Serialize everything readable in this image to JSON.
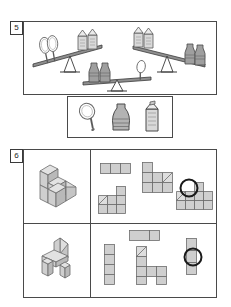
{
  "worksheet": {
    "title": "Geometry and logic worksheet page",
    "colors": {
      "ink": "#3a3a3a",
      "frame": "#4a4a4a",
      "block_face": "#cfcfcf",
      "block_top": "#e2e2e2",
      "block_side": "#b9b9b9",
      "block_outline": "#6b6b6b",
      "answer_mark": "#1a1a1a",
      "paper": "#ffffff"
    }
  },
  "exercise5": {
    "number": "5",
    "type": "balance-scale-logic",
    "instruction_text": "",
    "scales": [
      {
        "id": "scale-left",
        "left_pan": {
          "item": "racket",
          "count": 2
        },
        "right_pan": {
          "item": "carton",
          "count": 2
        },
        "tilt": "left-down",
        "heavier_side": "left"
      },
      {
        "id": "scale-right",
        "left_pan": {
          "item": "carton",
          "count": 2
        },
        "right_pan": {
          "item": "vase",
          "count": 2
        },
        "tilt": "right-down",
        "heavier_side": "right"
      },
      {
        "id": "scale-bottom",
        "left_pan": {
          "item": "vase",
          "count": 2
        },
        "right_pan": {
          "item": "racket",
          "count": 1
        },
        "tilt": "left-down",
        "heavier_side": "left"
      }
    ],
    "answer_tray": {
      "items": [
        {
          "id": "racket",
          "label": "racket",
          "icon": "racket-icon"
        },
        {
          "id": "vase",
          "label": "vase",
          "icon": "vase-icon"
        },
        {
          "id": "carton",
          "label": "carton",
          "icon": "milk-carton-icon"
        }
      ]
    }
  },
  "exercise6": {
    "number": "6",
    "type": "match-solid-to-top-view",
    "rows": [
      {
        "id": "row-1",
        "prompt": {
          "id": "solid-1",
          "label": "stepped block solid",
          "icon": "solid-3d-icon"
        },
        "options": [
          {
            "id": "opt-1a",
            "label": "1x3 strip",
            "selected": false
          },
          {
            "id": "opt-1b",
            "label": "L shape with ramp",
            "selected": false
          },
          {
            "id": "opt-1c",
            "label": "tall L with ramp",
            "selected": false
          },
          {
            "id": "opt-1d",
            "label": "stepped plan view",
            "selected": true
          }
        ],
        "selected_option": "opt-1d",
        "answer_mark": "circle"
      },
      {
        "id": "row-2",
        "prompt": {
          "id": "solid-2",
          "label": "chair shaped solid",
          "icon": "solid-3d-icon"
        },
        "options": [
          {
            "id": "opt-2a",
            "label": "vertical 1x4 strip",
            "selected": false
          },
          {
            "id": "opt-2b",
            "label": "horizontal 1x2 bar",
            "selected": false
          },
          {
            "id": "opt-2c",
            "label": "chair plan with ramp",
            "selected": false
          },
          {
            "id": "opt-2d",
            "label": "vertical 1x3 strip",
            "selected": true
          }
        ],
        "selected_option": "opt-2d",
        "answer_mark": "circle"
      }
    ]
  }
}
